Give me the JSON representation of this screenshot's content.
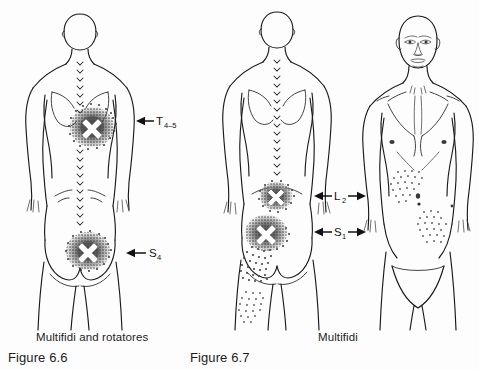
{
  "figures": [
    {
      "id": "figure-6-6",
      "caption_name": "Multifidi and rotatores",
      "caption_number": "Figure 6.6",
      "view": "posterior",
      "labels": [
        {
          "id": "t4-5",
          "main": "T",
          "sub": "4–5",
          "arrow": "single-left"
        },
        {
          "id": "s4",
          "main": "S",
          "sub": "4",
          "arrow": "single-left"
        }
      ],
      "trigger_points": [
        {
          "id": "thoracic-trigger-point",
          "region": "mid-thoracic",
          "marker": "X"
        },
        {
          "id": "sacral-trigger-point",
          "region": "sacral",
          "marker": "X"
        }
      ]
    },
    {
      "id": "figure-6-7",
      "caption_name": "Multifidi",
      "caption_number": "Figure 6.7",
      "view": "posterior-and-anterior",
      "labels": [
        {
          "id": "l2",
          "main": "L",
          "sub": "2",
          "arrow": "double"
        },
        {
          "id": "s1",
          "main": "S",
          "sub": "1",
          "arrow": "double"
        }
      ],
      "trigger_points": [
        {
          "id": "lumbar-trigger-point",
          "region": "upper-lumbar",
          "marker": "X"
        },
        {
          "id": "sacroiliac-trigger-point",
          "region": "sacroiliac",
          "marker": "X"
        }
      ]
    }
  ],
  "colors": {
    "background": "#fdfdfd",
    "outline": "#1a1a1a",
    "stipple_dark": "#4a4a4a",
    "stipple_light": "#6b6b6b",
    "marker": "#ffffff",
    "text": "#1c1c1c"
  }
}
